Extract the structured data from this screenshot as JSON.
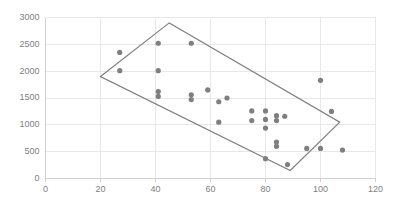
{
  "chart_data": {
    "type": "scatter",
    "title": "",
    "xlabel": "",
    "ylabel": "",
    "xlim": [
      0,
      120
    ],
    "ylim": [
      0,
      3000
    ],
    "xticks": [
      0,
      20,
      40,
      60,
      80,
      100,
      120
    ],
    "yticks": [
      0,
      500,
      1000,
      1500,
      2000,
      2500,
      3000
    ],
    "grid": true,
    "legend": "none",
    "marker_color": "#7f7f7f",
    "outline_color": "#808080",
    "points": [
      {
        "x": 27,
        "y": 2350
      },
      {
        "x": 27,
        "y": 2010
      },
      {
        "x": 41,
        "y": 2520
      },
      {
        "x": 41,
        "y": 2010
      },
      {
        "x": 41,
        "y": 1620
      },
      {
        "x": 41,
        "y": 1530
      },
      {
        "x": 53,
        "y": 2520
      },
      {
        "x": 53,
        "y": 1560
      },
      {
        "x": 53,
        "y": 1470
      },
      {
        "x": 59,
        "y": 1650
      },
      {
        "x": 63,
        "y": 1430
      },
      {
        "x": 63,
        "y": 1050
      },
      {
        "x": 66,
        "y": 1500
      },
      {
        "x": 75,
        "y": 1260
      },
      {
        "x": 75,
        "y": 1080
      },
      {
        "x": 80,
        "y": 1260
      },
      {
        "x": 80,
        "y": 1100
      },
      {
        "x": 80,
        "y": 940
      },
      {
        "x": 80,
        "y": 370
      },
      {
        "x": 84,
        "y": 1170
      },
      {
        "x": 84,
        "y": 1080
      },
      {
        "x": 84,
        "y": 680
      },
      {
        "x": 84,
        "y": 600
      },
      {
        "x": 87,
        "y": 1160
      },
      {
        "x": 88,
        "y": 260
      },
      {
        "x": 95,
        "y": 560
      },
      {
        "x": 100,
        "y": 1830
      },
      {
        "x": 100,
        "y": 560
      },
      {
        "x": 104,
        "y": 1250
      },
      {
        "x": 108,
        "y": 530
      }
    ],
    "outline_polygon": [
      {
        "x": 20,
        "y": 1900
      },
      {
        "x": 45,
        "y": 2900
      },
      {
        "x": 107,
        "y": 1050
      },
      {
        "x": 89,
        "y": 150
      }
    ]
  }
}
